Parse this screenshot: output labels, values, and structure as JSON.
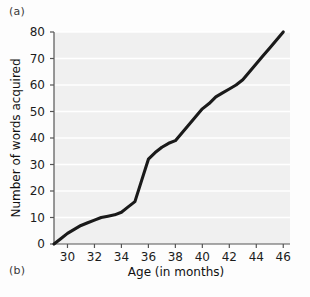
{
  "figure": {
    "panel_a_label": "(a)",
    "panel_b_label": "(b)",
    "background_color": "#fdfdfd",
    "plot_background_color": "#f0f0f0",
    "gridline_color": "#ffffff",
    "line_color": "#1a1a1a",
    "axis_color": "#555555"
  },
  "chart_data": {
    "type": "line",
    "title": "",
    "xlabel": "Age (in months)",
    "ylabel": "Number of words acquired",
    "xlim": [
      29,
      46.5
    ],
    "ylim": [
      0,
      80
    ],
    "xticks": [
      30,
      32,
      34,
      36,
      38,
      40,
      42,
      44,
      46
    ],
    "yticks": [
      0,
      10,
      20,
      30,
      40,
      50,
      60,
      70,
      80
    ],
    "xtick_labels": [
      "30",
      "32",
      "34",
      "36",
      "38",
      "40",
      "42",
      "44",
      "46"
    ],
    "ytick_labels": [
      "0",
      "10",
      "20",
      "30",
      "40",
      "50",
      "60",
      "70",
      "80"
    ],
    "grid": "horizontal",
    "legend": "none",
    "series": [
      {
        "name": "Words acquired",
        "x": [
          29.0,
          29.5,
          30.0,
          30.5,
          31.0,
          31.5,
          32.0,
          32.5,
          33.0,
          33.5,
          34.0,
          34.5,
          35.0,
          35.5,
          36.0,
          36.5,
          37.0,
          37.5,
          38.0,
          38.5,
          39.0,
          39.5,
          40.0,
          40.5,
          41.0,
          41.5,
          42.0,
          42.5,
          43.0,
          43.5,
          44.0,
          44.5,
          45.0,
          45.5,
          46.0
        ],
        "y": [
          0,
          2,
          4,
          5.5,
          7,
          8,
          9,
          10,
          10.5,
          11,
          12,
          14,
          16,
          24,
          32,
          34.5,
          36.5,
          38,
          39,
          42,
          45,
          48,
          51,
          53,
          55.5,
          57,
          58.5,
          60,
          62,
          65,
          68,
          71,
          74,
          77,
          80
        ]
      }
    ]
  }
}
